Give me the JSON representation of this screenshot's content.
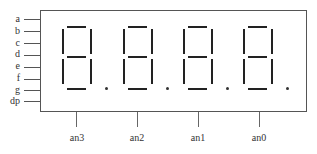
{
  "diagram": {
    "segment_pins": [
      "a",
      "b",
      "c",
      "d",
      "e",
      "f",
      "g",
      "dp"
    ],
    "anode_pins": [
      "an3",
      "an2",
      "an1",
      "an0"
    ],
    "digits": [
      {
        "id": "digit-3",
        "anode": "an3",
        "segments": [
          "a",
          "b",
          "c",
          "d",
          "e",
          "f",
          "g"
        ],
        "dp": true
      },
      {
        "id": "digit-2",
        "anode": "an2",
        "segments": [
          "a",
          "b",
          "c",
          "d",
          "e",
          "f",
          "g"
        ],
        "dp": true
      },
      {
        "id": "digit-1",
        "anode": "an1",
        "segments": [
          "a",
          "b",
          "c",
          "d",
          "e",
          "f",
          "g"
        ],
        "dp": true
      },
      {
        "id": "digit-0",
        "anode": "an0",
        "segments": [
          "a",
          "b",
          "c",
          "d",
          "e",
          "f",
          "g"
        ],
        "dp": true
      }
    ],
    "colors": {
      "line": "#555555",
      "segment": "#222222",
      "background": "#ffffff"
    }
  }
}
